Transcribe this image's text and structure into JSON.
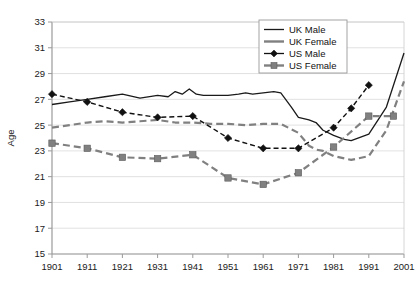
{
  "chart_data": {
    "type": "line",
    "title": "",
    "subtitle": "",
    "xlabel": "",
    "ylabel": "Age",
    "x": [
      1901,
      1911,
      1921,
      1931,
      1941,
      1951,
      1961,
      1971,
      1981,
      1991,
      2001
    ],
    "xlim": [
      1901,
      2001
    ],
    "ylim": [
      15,
      33
    ],
    "yticks": [
      15,
      17,
      19,
      21,
      23,
      25,
      27,
      29,
      31,
      33
    ],
    "xticks": [
      "1901",
      "1911",
      "1921",
      "1931",
      "1941",
      "1951",
      "1961",
      "1971",
      "1981",
      "1991",
      "2001"
    ],
    "grid": true,
    "grid_axis": "y",
    "legend_position": "top-right",
    "legend": [
      "UK Male",
      "UK Female",
      "US Male",
      "US Female"
    ],
    "series": [
      {
        "name": "UK Male",
        "style": "solid",
        "color": "#1a1a1a",
        "marker": "none",
        "x": [
          1901,
          1906,
          1911,
          1916,
          1921,
          1926,
          1931,
          1934,
          1936,
          1938,
          1940,
          1942,
          1944,
          1946,
          1948,
          1951,
          1954,
          1956,
          1958,
          1961,
          1964,
          1966,
          1969,
          1971,
          1974,
          1976,
          1978,
          1981,
          1984,
          1986,
          1991,
          1996,
          2001
        ],
        "y": [
          26.6,
          26.8,
          27.0,
          27.2,
          27.4,
          27.1,
          27.3,
          27.2,
          27.6,
          27.4,
          27.8,
          27.4,
          27.3,
          27.3,
          27.3,
          27.3,
          27.4,
          27.5,
          27.4,
          27.5,
          27.6,
          27.5,
          26.4,
          25.6,
          25.4,
          25.2,
          24.6,
          24.2,
          23.9,
          23.8,
          24.3,
          26.4,
          30.6
        ]
      },
      {
        "name": "UK Female",
        "style": "dashed",
        "color": "#808080",
        "marker": "none",
        "x": [
          1901,
          1906,
          1911,
          1916,
          1921,
          1926,
          1931,
          1936,
          1941,
          1946,
          1951,
          1956,
          1961,
          1966,
          1971,
          1974,
          1976,
          1978,
          1981,
          1986,
          1991,
          1996,
          2001
        ],
        "y": [
          24.8,
          25.0,
          25.2,
          25.3,
          25.2,
          25.3,
          25.4,
          25.2,
          25.2,
          25.1,
          25.1,
          25.0,
          25.1,
          25.1,
          24.4,
          23.4,
          23.1,
          23.0,
          22.6,
          22.3,
          22.6,
          24.6,
          28.4
        ]
      },
      {
        "name": "US Male",
        "style": "dashed",
        "color": "#111111",
        "marker": "diamond",
        "x": [
          1901,
          1911,
          1921,
          1931,
          1941,
          1951,
          1961,
          1971,
          1981,
          1986,
          1991
        ],
        "y": [
          27.4,
          26.8,
          26.0,
          25.6,
          25.7,
          24.0,
          23.2,
          23.2,
          24.8,
          26.3,
          28.1
        ]
      },
      {
        "name": "US Female",
        "style": "dashed",
        "color": "#808080",
        "marker": "square",
        "x": [
          1901,
          1911,
          1921,
          1931,
          1941,
          1951,
          1961,
          1971,
          1981,
          1991,
          1998
        ],
        "y": [
          23.6,
          23.2,
          22.5,
          22.4,
          22.7,
          20.9,
          20.4,
          21.3,
          23.3,
          25.7,
          25.7
        ]
      }
    ]
  },
  "legend_items": [
    {
      "label": "UK Male",
      "style": "solid",
      "marker": "none",
      "color": "#1a1a1a"
    },
    {
      "label": "UK Female",
      "style": "solid-thick",
      "marker": "none",
      "color": "#808080"
    },
    {
      "label": "US Male",
      "style": "solid",
      "marker": "diamond",
      "color": "#111111"
    },
    {
      "label": "US Female",
      "style": "solid-thick",
      "marker": "square",
      "color": "#808080"
    }
  ]
}
